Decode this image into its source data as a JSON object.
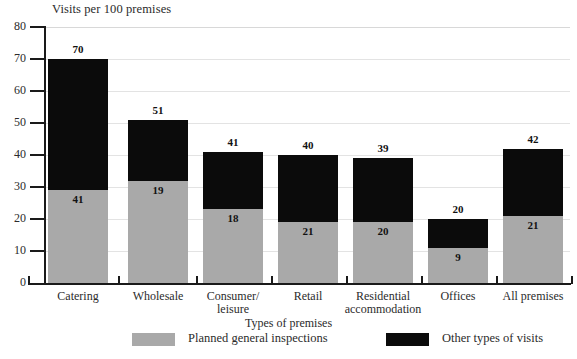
{
  "chart_data": {
    "type": "bar",
    "stacked": true,
    "title": "Visits per 100 premises",
    "xlabel": "Types of premises",
    "ylabel": "",
    "ylim": [
      0,
      80
    ],
    "yticks": [
      0,
      10,
      20,
      30,
      40,
      50,
      60,
      70,
      80
    ],
    "grid": true,
    "legend_position": "bottom",
    "categories": [
      "Catering",
      "Wholesale",
      "Consumer/ leisure",
      "Retail",
      "Residential accommodation",
      "Offices",
      "All premises"
    ],
    "series": [
      {
        "name": "Planned general inspections",
        "color": "#a9a9a9",
        "values": [
          29,
          32,
          23,
          19,
          19,
          11,
          21
        ]
      },
      {
        "name": "Other types of visits",
        "color": "#0b0b0b",
        "values": [
          41,
          19,
          18,
          21,
          20,
          9,
          21
        ]
      }
    ],
    "totals": [
      70,
      51,
      41,
      40,
      39,
      20,
      42
    ],
    "inner_labels": [
      "41",
      "19",
      "18",
      "21",
      "20",
      "9",
      "21"
    ],
    "total_labels": [
      "70",
      "51",
      "41",
      "40",
      "39",
      "20",
      "42"
    ],
    "colors": {
      "planned": "#a9a9a9",
      "other": "#0b0b0b",
      "axis": "#1a1a1a",
      "grid": "#e3e3e3",
      "text": "#2b2b2b"
    }
  },
  "bars": [
    {
      "category_lines": [
        "Catering"
      ],
      "total_label": "70",
      "inner_label": "41",
      "total": 70,
      "gray": 29
    },
    {
      "category_lines": [
        "Wholesale"
      ],
      "total_label": "51",
      "inner_label": "19",
      "total": 51,
      "gray": 32
    },
    {
      "category_lines": [
        "Consumer/",
        "leisure"
      ],
      "total_label": "41",
      "inner_label": "18",
      "total": 41,
      "gray": 23
    },
    {
      "category_lines": [
        "Retail"
      ],
      "total_label": "40",
      "inner_label": "21",
      "total": 40,
      "gray": 19
    },
    {
      "category_lines": [
        "Residential",
        "accommodation"
      ],
      "total_label": "39",
      "inner_label": "20",
      "total": 39,
      "gray": 19
    },
    {
      "category_lines": [
        "Offices"
      ],
      "total_label": "20",
      "inner_label": "9",
      "total": 20,
      "gray": 11
    },
    {
      "category_lines": [
        "All premises"
      ],
      "total_label": "42",
      "inner_label": "21",
      "total": 42,
      "gray": 21
    }
  ],
  "y_axis": {
    "ticks": [
      "0",
      "10",
      "20",
      "30",
      "40",
      "50",
      "60",
      "70",
      "80"
    ]
  },
  "legend": {
    "entries": [
      {
        "label": "Planned general inspections",
        "swatch": "gray"
      },
      {
        "label": "Other types of visits",
        "swatch": "black"
      }
    ]
  }
}
